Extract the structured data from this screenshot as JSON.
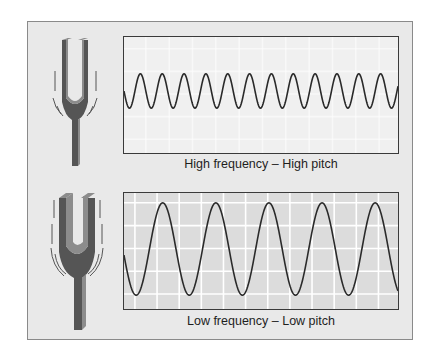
{
  "figure": {
    "panels": [
      {
        "id": "high",
        "caption": "High frequency – High pitch",
        "fork_vibration": "small",
        "wave": {
          "type": "sine",
          "period_px": 22,
          "amplitude_px": 17.5,
          "cycles_visible": 12.5,
          "phase": "starts at midline descending"
        },
        "grid_visible": "faint"
      },
      {
        "id": "low",
        "caption": "Low frequency – Low pitch",
        "fork_vibration": "large",
        "wave": {
          "type": "sine",
          "period_px": 53.5,
          "amplitude_px": 47,
          "cycles_visible": 5.2,
          "phase": "starts below midline descending"
        },
        "grid_visible": "strong"
      }
    ],
    "colors": {
      "panel_bg": "#e9e9e9",
      "scope_high_bg": "#f0f0f0",
      "scope_low_bg": "#dcdcdc",
      "grid": "#ffffff",
      "wave": "#2a2a2a",
      "fork_dark": "#555555",
      "fork_light": "#8c8c8c"
    }
  }
}
